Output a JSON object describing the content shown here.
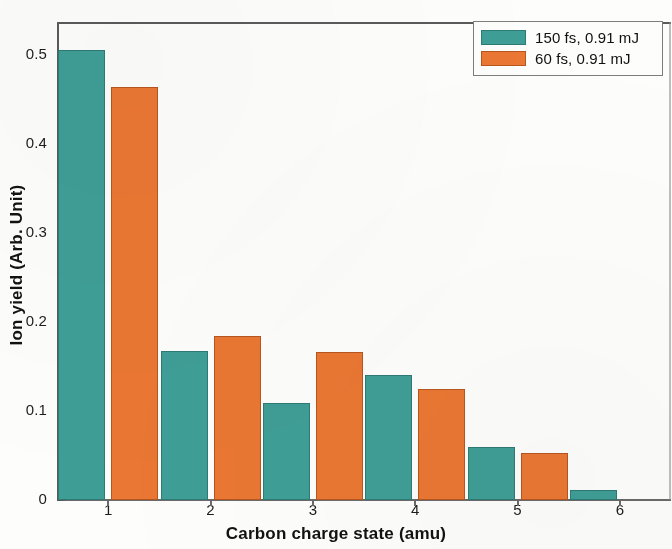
{
  "chart_data": {
    "type": "bar",
    "title": "",
    "xlabel": "Carbon charge state (amu)",
    "ylabel": "Ion yield (Arb. Unit)",
    "categories": [
      "1",
      "2",
      "3",
      "4",
      "5",
      "6"
    ],
    "series": [
      {
        "name": "150 fs, 0.91 mJ",
        "color": "#3e9e96",
        "values": [
          0.506,
          0.168,
          0.109,
          0.141,
          0.06,
          0.011
        ]
      },
      {
        "name": "60 fs, 0.91 mJ",
        "color": "#ea7733",
        "values": [
          0.464,
          0.184,
          0.166,
          0.125,
          0.053,
          0.0
        ]
      }
    ],
    "ylim": [
      0,
      0.5375
    ],
    "xlim_categories": [
      0.5,
      6.5
    ],
    "yticks": [
      0,
      0.1,
      0.2,
      0.3,
      0.4,
      0.5
    ],
    "ytick_labels": [
      "0",
      "0.1",
      "0.2",
      "0.3",
      "0.4",
      "0.5"
    ],
    "xticks": [
      "1",
      "2",
      "3",
      "4",
      "5",
      "6"
    ],
    "grid": false,
    "legend_position": "top-right"
  },
  "legend": {
    "entries": [
      {
        "label": "150 fs, 0.91 mJ",
        "color": "#3e9e96"
      },
      {
        "label": "60 fs, 0.91 mJ",
        "color": "#ea7733"
      }
    ]
  },
  "axes": {
    "y_title": "Ion yield (Arb. Unit)",
    "x_title": "Carbon charge state (amu)",
    "y_ticks": [
      "0.5",
      "0.4",
      "0.3",
      "0.2",
      "0.1",
      "0"
    ],
    "x_ticks": [
      "1",
      "2",
      "3",
      "4",
      "5",
      "6"
    ]
  }
}
